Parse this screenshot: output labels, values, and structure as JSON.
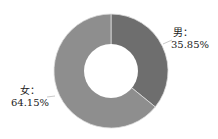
{
  "chart_data": {
    "type": "pie",
    "variant": "donut",
    "title": "",
    "categories": [
      "男",
      "女"
    ],
    "values": [
      35.85,
      64.15
    ],
    "unit": "%",
    "labels": [
      {
        "name": "男：",
        "value": "35.85%"
      },
      {
        "name": "女：",
        "value": "64.15%"
      }
    ],
    "colors": [
      "#6e6e6e",
      "#8e8e8e"
    ],
    "start_angle": "12 o'clock, clockwise",
    "legend": "none (inline labels with leader lines)"
  }
}
